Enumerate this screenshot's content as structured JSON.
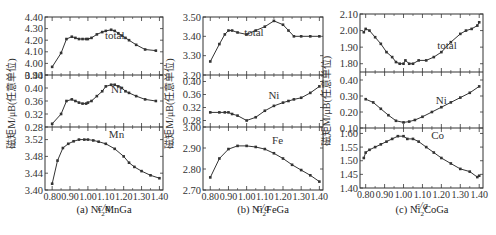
{
  "figure": {
    "ylabel": "磁矩M/μB(任意单位)",
    "xlabel": "c/a",
    "line_color": "#333333"
  },
  "captions": [
    {
      "prefix": "(a) Ni",
      "sub": "2",
      "suffix": "MnGa"
    },
    {
      "prefix": "(b) Ni",
      "sub": "2",
      "suffix": "FeGa"
    },
    {
      "prefix": "(c) Ni",
      "sub": "2",
      "suffix": "CoGa"
    }
  ],
  "chart_data": [
    {
      "type": "line",
      "title": "(a) Ni2MnGa",
      "xlabel": "c/a",
      "ylabel": "磁矩M/μB(任意单位)",
      "x_ticks": [
        "0.80",
        "0.90",
        "1.00",
        "1.10",
        "1.20",
        "1.30",
        "1.40"
      ],
      "xlim": [
        0.76,
        1.42
      ],
      "panels": [
        {
          "label": "total",
          "label_pos": [
            1.15,
            4.21
          ],
          "ylim": [
            3.9,
            4.4
          ],
          "y_ticks": [
            "3.90",
            "4.00",
            "4.10",
            "4.20",
            "4.30",
            "4.40"
          ],
          "x": [
            0.8,
            0.85,
            0.88,
            0.91,
            0.93,
            0.95,
            0.97,
            0.99,
            1.0,
            1.02,
            1.05,
            1.08,
            1.1,
            1.13,
            1.15,
            1.17,
            1.19,
            1.21,
            1.23,
            1.27,
            1.32,
            1.38
          ],
          "y": [
            3.97,
            4.09,
            4.21,
            4.23,
            4.22,
            4.21,
            4.21,
            4.21,
            4.21,
            4.22,
            4.25,
            4.27,
            4.28,
            4.29,
            4.28,
            4.26,
            4.24,
            4.22,
            4.2,
            4.16,
            4.12,
            4.11
          ]
        },
        {
          "label": "Ni",
          "label_pos": [
            1.16,
            0.385
          ],
          "ylim": [
            0.28,
            0.44
          ],
          "y_ticks": [
            "0.28",
            "0.32",
            "0.36",
            "0.40",
            "0.44"
          ],
          "x": [
            0.8,
            0.85,
            0.88,
            0.91,
            0.93,
            0.95,
            0.97,
            0.99,
            1.0,
            1.02,
            1.05,
            1.08,
            1.1,
            1.13,
            1.15,
            1.17,
            1.19,
            1.21,
            1.23,
            1.27,
            1.32,
            1.38
          ],
          "y": [
            0.29,
            0.32,
            0.36,
            0.365,
            0.36,
            0.355,
            0.352,
            0.352,
            0.355,
            0.36,
            0.375,
            0.39,
            0.405,
            0.41,
            0.41,
            0.405,
            0.4,
            0.39,
            0.385,
            0.375,
            0.365,
            0.36
          ]
        },
        {
          "label": "Mn",
          "label_pos": [
            1.16,
            3.525
          ],
          "ylim": [
            3.4,
            3.55
          ],
          "y_ticks": [
            "3.40",
            "3.44",
            "3.48",
            "3.52"
          ],
          "x": [
            0.8,
            0.83,
            0.86,
            0.89,
            0.92,
            0.95,
            0.98,
            1.0,
            1.03,
            1.06,
            1.1,
            1.15,
            1.2,
            1.23,
            1.26,
            1.3,
            1.35,
            1.4
          ],
          "y": [
            3.415,
            3.47,
            3.5,
            3.51,
            3.516,
            3.52,
            3.52,
            3.52,
            3.518,
            3.515,
            3.51,
            3.498,
            3.48,
            3.465,
            3.455,
            3.445,
            3.435,
            3.428
          ]
        }
      ]
    },
    {
      "type": "line",
      "title": "(b) Ni2FeGa",
      "xlabel": "c/a",
      "ylabel": "磁矩M/μB(任意单位)",
      "x_ticks": [
        "0.80",
        "0.90",
        "1.00",
        "1.10",
        "1.20",
        "1.30",
        "1.40"
      ],
      "xlim": [
        0.76,
        1.42
      ],
      "panels": [
        {
          "label": "total",
          "label_pos": [
            1.04,
            3.4
          ],
          "ylim": [
            3.2,
            3.5
          ],
          "y_ticks": [
            "3.20",
            "3.30",
            "3.40",
            "3.50"
          ],
          "x": [
            0.8,
            0.85,
            0.88,
            0.9,
            0.92,
            0.95,
            1.0,
            1.05,
            1.1,
            1.15,
            1.2,
            1.23,
            1.26,
            1.3,
            1.35,
            1.4
          ],
          "y": [
            3.27,
            3.36,
            3.41,
            3.43,
            3.43,
            3.42,
            3.41,
            3.43,
            3.45,
            3.48,
            3.46,
            3.43,
            3.4,
            3.4,
            3.4,
            3.4
          ]
        },
        {
          "label": "Ni",
          "label_pos": [
            1.15,
            0.345
          ],
          "ylim": [
            0.26,
            0.42
          ],
          "y_ticks": [
            "0.28",
            "0.32",
            "0.36",
            "0.40"
          ],
          "x": [
            0.8,
            0.85,
            0.88,
            0.9,
            0.92,
            0.95,
            1.0,
            1.05,
            1.1,
            1.15,
            1.2,
            1.23,
            1.26,
            1.3,
            1.35,
            1.4
          ],
          "y": [
            0.305,
            0.305,
            0.305,
            0.305,
            0.3,
            0.295,
            0.28,
            0.29,
            0.31,
            0.325,
            0.335,
            0.34,
            0.345,
            0.35,
            0.365,
            0.385
          ]
        },
        {
          "label": "Fe",
          "label_pos": [
            1.17,
            2.92
          ],
          "ylim": [
            2.7,
            3.0
          ],
          "y_ticks": [
            "2.70",
            "2.80",
            "2.90",
            "3.00"
          ],
          "x": [
            0.8,
            0.85,
            0.9,
            0.95,
            1.0,
            1.05,
            1.1,
            1.15,
            1.2,
            1.25,
            1.3,
            1.35,
            1.4
          ],
          "y": [
            2.76,
            2.85,
            2.895,
            2.91,
            2.91,
            2.905,
            2.895,
            2.875,
            2.85,
            2.82,
            2.795,
            2.77,
            2.74
          ]
        }
      ]
    },
    {
      "type": "line",
      "title": "(c) Ni2CoGa",
      "xlabel": "c/a",
      "ylabel": "磁矩M/μB(任意单位)",
      "x_ticks": [
        "0.80",
        "0.90",
        "1.00",
        "1.10",
        "1.20",
        "1.30",
        "1.40"
      ],
      "xlim": [
        0.77,
        1.42
      ],
      "panels": [
        {
          "label": "total",
          "label_pos": [
            1.23,
            1.89
          ],
          "ylim": [
            1.75,
            2.1
          ],
          "y_ticks": [
            "1.80",
            "1.90",
            "2.00",
            "2.10"
          ],
          "x": [
            0.79,
            0.8,
            0.82,
            0.85,
            0.88,
            0.91,
            0.94,
            0.96,
            0.98,
            1.0,
            1.01,
            1.03,
            1.05,
            1.08,
            1.12,
            1.16,
            1.2,
            1.25,
            1.3,
            1.33,
            1.36,
            1.39,
            1.4
          ],
          "y": [
            1.99,
            2.01,
            2.0,
            1.96,
            1.92,
            1.87,
            1.84,
            1.81,
            1.8,
            1.8,
            1.82,
            1.8,
            1.8,
            1.82,
            1.82,
            1.84,
            1.87,
            1.93,
            1.98,
            2.0,
            2.01,
            2.03,
            2.05
          ]
        },
        {
          "label": "Ni",
          "label_pos": [
            1.2,
            0.25
          ],
          "ylim": [
            0.1,
            0.45
          ],
          "y_ticks": [
            "0.10",
            "0.20",
            "0.30",
            "0.40"
          ],
          "x": [
            0.8,
            0.84,
            0.88,
            0.92,
            0.96,
            1.0,
            1.03,
            1.06,
            1.1,
            1.15,
            1.2,
            1.25,
            1.3,
            1.35,
            1.4
          ],
          "y": [
            0.28,
            0.26,
            0.22,
            0.18,
            0.145,
            0.135,
            0.14,
            0.15,
            0.17,
            0.2,
            0.23,
            0.26,
            0.29,
            0.32,
            0.36
          ]
        },
        {
          "label": "Co",
          "label_pos": [
            1.18,
            1.58
          ],
          "ylim": [
            1.4,
            1.62
          ],
          "y_ticks": [
            "1.40",
            "1.45",
            "1.50",
            "1.55",
            "1.60"
          ],
          "x": [
            0.79,
            0.8,
            0.82,
            0.85,
            0.88,
            0.91,
            0.94,
            0.97,
            1.0,
            1.02,
            1.05,
            1.08,
            1.12,
            1.16,
            1.2,
            1.25,
            1.3,
            1.35,
            1.39,
            1.4
          ],
          "y": [
            1.51,
            1.53,
            1.54,
            1.55,
            1.56,
            1.57,
            1.58,
            1.59,
            1.59,
            1.58,
            1.58,
            1.57,
            1.55,
            1.53,
            1.51,
            1.49,
            1.47,
            1.46,
            1.44,
            1.445
          ]
        }
      ]
    }
  ]
}
